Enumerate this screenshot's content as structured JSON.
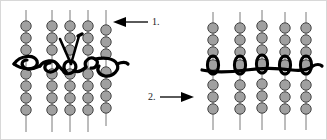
{
  "diagram": {
    "background_color": "#ffffff",
    "border_color": "#d8d8d8",
    "bead": {
      "fill_color": "#a0a0a0",
      "stroke_color": "#444444",
      "shape": "circle",
      "radius_px": 5.2
    },
    "warp_thread": {
      "color": "#7a7a7a",
      "width_px": 1,
      "name": "vertical-bead-strand-line"
    },
    "working_thread": {
      "color": "#000000",
      "width_px": 3.2,
      "name": "horizontal-working-thread"
    },
    "needle": {
      "color": "#000000",
      "name": "needle-passing-through-beads"
    },
    "steps": [
      {
        "id": "step-1",
        "number_label": "1.",
        "arrow_direction": "left",
        "arrow_name": "arrow-pointing-left",
        "points_to": "left-diagram",
        "description": "Working thread woven in a looping zigzag across five vertical bead strands, needle pulled up through the beadwork."
      },
      {
        "id": "step-2",
        "number_label": "2.",
        "arrow_direction": "right",
        "arrow_name": "arrow-pointing-right",
        "points_to": "right-diagram",
        "description": "Working thread pulled taut so each loop closes into a vertical oval around one bead in each strand."
      }
    ],
    "panels": [
      {
        "id": "left-panel",
        "name": "left-beadwork-diagram",
        "column_count": 5,
        "beads_per_column": 7,
        "thread_state": "loose-looping"
      },
      {
        "id": "right-panel",
        "name": "right-beadwork-diagram",
        "column_count": 5,
        "beads_per_column": 7,
        "thread_state": "pulled-tight"
      }
    ]
  }
}
